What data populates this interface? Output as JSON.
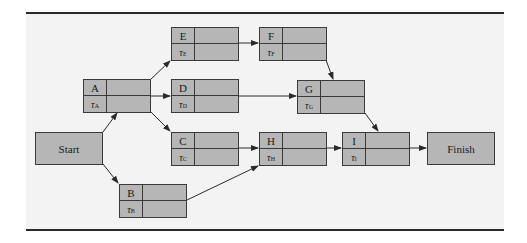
{
  "diagram": {
    "type": "project-network-activity-on-node",
    "colors": {
      "node_fill": "#b6b6b6",
      "panel": "#f3f3f3",
      "line": "#3a3a3a"
    },
    "start": {
      "label": "Start"
    },
    "finish": {
      "label": "Finish"
    },
    "nodes": [
      {
        "id": "A",
        "name": "A",
        "tau": "τ",
        "tau_sub": "A"
      },
      {
        "id": "B",
        "name": "B",
        "tau": "τ",
        "tau_sub": "B"
      },
      {
        "id": "C",
        "name": "C",
        "tau": "τ",
        "tau_sub": "C"
      },
      {
        "id": "D",
        "name": "D",
        "tau": "τ",
        "tau_sub": "D"
      },
      {
        "id": "E",
        "name": "E",
        "tau": "τ",
        "tau_sub": "E"
      },
      {
        "id": "F",
        "name": "F",
        "tau": "τ",
        "tau_sub": "F"
      },
      {
        "id": "G",
        "name": "G",
        "tau": "τ",
        "tau_sub": "G"
      },
      {
        "id": "H",
        "name": "H",
        "tau": "τ",
        "tau_sub": "H"
      },
      {
        "id": "I",
        "name": "I",
        "tau": "τ",
        "tau_sub": "I"
      }
    ],
    "edges": [
      [
        "Start",
        "A"
      ],
      [
        "Start",
        "B"
      ],
      [
        "A",
        "E"
      ],
      [
        "A",
        "D"
      ],
      [
        "A",
        "C"
      ],
      [
        "E",
        "F"
      ],
      [
        "F",
        "G"
      ],
      [
        "D",
        "G"
      ],
      [
        "C",
        "H"
      ],
      [
        "B",
        "H"
      ],
      [
        "G",
        "I"
      ],
      [
        "H",
        "I"
      ],
      [
        "I",
        "Finish"
      ]
    ]
  }
}
